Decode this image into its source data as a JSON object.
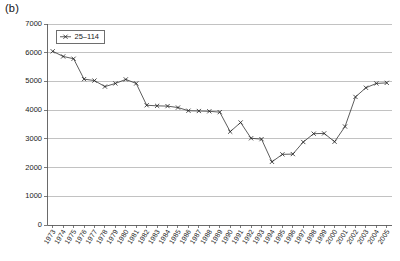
{
  "figure": {
    "panel_label": "(b)"
  },
  "chart_data": {
    "type": "line",
    "title": "",
    "xlabel": "",
    "ylabel": "",
    "ylim": [
      0,
      7000
    ],
    "ytick_step": 1000,
    "yticks": [
      0,
      1000,
      2000,
      3000,
      4000,
      5000,
      6000,
      7000
    ],
    "ytick_labels": [
      "0",
      "1000",
      "2000",
      "3000",
      "4000",
      "5000",
      "6000",
      "7000"
    ],
    "grid": true,
    "grid_axis": "y",
    "legend_position": "top-left-inside",
    "legend": [
      "25–114"
    ],
    "marker": "x",
    "line_color": "#333333",
    "categories": [
      "1973",
      "1974",
      "1975",
      "1976",
      "1977",
      "1978",
      "1979",
      "1980",
      "1981",
      "1982",
      "1983",
      "1984",
      "1985",
      "1986",
      "1987",
      "1988",
      "1989",
      "1990",
      "1991",
      "1992",
      "1993",
      "1994",
      "1995",
      "1996",
      "1997",
      "1998",
      "1999",
      "2000",
      "2001",
      "2002",
      "2003",
      "2004",
      "2005"
    ],
    "series": [
      {
        "name": "25–114",
        "values": [
          6050,
          5870,
          5790,
          5080,
          5030,
          4820,
          4930,
          5070,
          4930,
          4170,
          4150,
          4140,
          4090,
          3980,
          3970,
          3960,
          3930,
          3250,
          3570,
          3020,
          2990,
          2200,
          2460,
          2470,
          2890,
          3180,
          3190,
          2900,
          3430,
          4460,
          4780,
          4930,
          4950
        ]
      }
    ]
  }
}
